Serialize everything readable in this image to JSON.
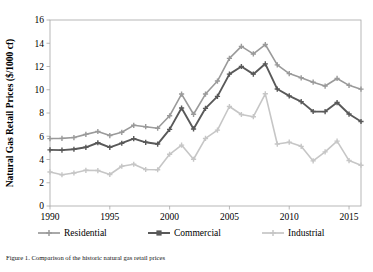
{
  "figure": {
    "y_axis_title": "Natural Gas Retail Prices ($/1000 cf)",
    "caption": "Figure 1. Comparison of the historic natural gas retail prices"
  },
  "legend": {
    "position": "bottom",
    "items": [
      {
        "label": "Residential",
        "color": "#9a9a9a",
        "marker": "plus"
      },
      {
        "label": "Commercial",
        "color": "#595959",
        "marker": "square"
      },
      {
        "label": "Industrial",
        "color": "#c6c6c6",
        "marker": "plus"
      }
    ]
  },
  "chart_data": {
    "type": "line",
    "title": "",
    "xlabel": "",
    "ylabel": "Natural Gas Retail Prices ($/1000 cf)",
    "xlim": [
      1990,
      2016
    ],
    "ylim": [
      0,
      16
    ],
    "grid": false,
    "xticks": [
      "1990",
      "1995",
      "2000",
      "2005",
      "2010",
      "2015"
    ],
    "yticks": [
      "0",
      "2",
      "4",
      "6",
      "8",
      "10",
      "12",
      "14",
      "16"
    ],
    "x": [
      1990,
      1991,
      1992,
      1993,
      1994,
      1995,
      1996,
      1997,
      1998,
      1999,
      2000,
      2001,
      2002,
      2003,
      2004,
      2005,
      2006,
      2007,
      2008,
      2009,
      2010,
      2011,
      2012,
      2013,
      2014,
      2015,
      2016
    ],
    "series": [
      {
        "name": "Residential",
        "color": "#9a9a9a",
        "values": [
          5.8,
          5.82,
          5.89,
          6.16,
          6.41,
          6.06,
          6.34,
          6.94,
          6.82,
          6.69,
          7.76,
          9.63,
          7.89,
          9.63,
          10.75,
          12.7,
          13.73,
          13.08,
          13.89,
          12.14,
          11.39,
          11.03,
          10.65,
          10.32,
          10.97,
          10.38,
          10.05
        ]
      },
      {
        "name": "Commercial",
        "color": "#595959",
        "values": [
          4.83,
          4.81,
          4.88,
          5.05,
          5.44,
          5.05,
          5.4,
          5.8,
          5.48,
          5.33,
          6.59,
          8.43,
          6.63,
          8.4,
          9.43,
          11.34,
          12.0,
          11.34,
          12.23,
          10.06,
          9.47,
          8.98,
          8.13,
          8.12,
          8.9,
          7.91,
          7.27
        ]
      },
      {
        "name": "Industrial",
        "color": "#c6c6c6",
        "values": [
          2.93,
          2.69,
          2.84,
          3.07,
          3.05,
          2.71,
          3.42,
          3.59,
          3.14,
          3.12,
          4.45,
          5.24,
          4.02,
          5.81,
          6.53,
          8.56,
          7.87,
          7.68,
          9.65,
          5.33,
          5.49,
          5.13,
          3.88,
          4.66,
          5.58,
          3.91,
          3.51
        ]
      }
    ]
  }
}
